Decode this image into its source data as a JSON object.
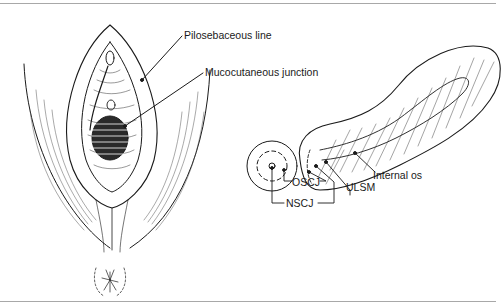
{
  "figure": {
    "labels": {
      "pilosebaceous": "Pilosebaceous line",
      "mucocutaneous": "Mucocutaneous junction",
      "oscj": "OSCJ",
      "nscj": "NSCJ",
      "ulsm": "ULSM",
      "internal_os": "Internal os"
    },
    "colors": {
      "ink": "#1a1a1a",
      "rule": "#a8a8a8",
      "background": "#ffffff"
    }
  }
}
